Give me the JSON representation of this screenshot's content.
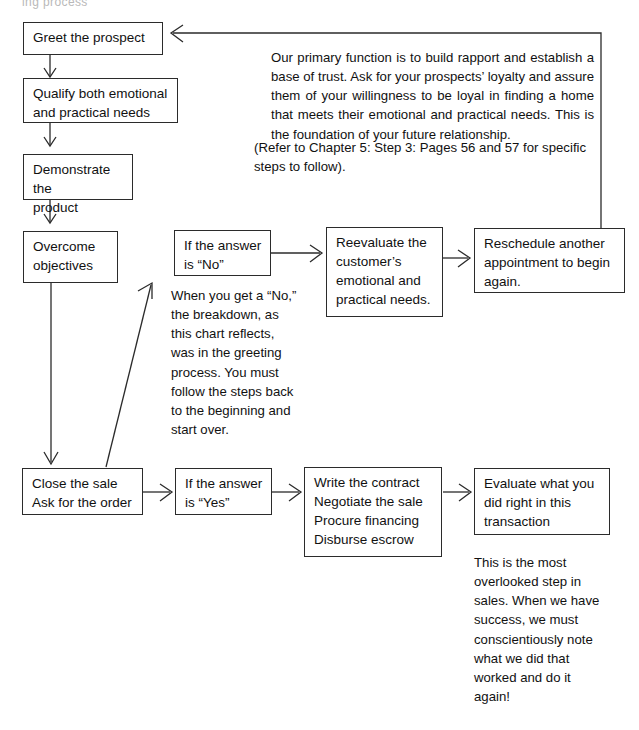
{
  "diagram": {
    "title_fragment": "ing  process",
    "nodes": {
      "greet": "Greet the  prospect",
      "qualify": "Qualify both emotional\nand practical needs",
      "demonstrate": "Demonstrate the\nproduct",
      "overcome": "Overcome\nobjectives",
      "answer_no": "If the answer\nis “No”",
      "reevaluate": "Reevaluate the\ncustomer’s\nemotional and\npractical needs.",
      "reschedule": "Reschedule another\nappointment to begin\nagain.",
      "close_sale": "Close the sale\nAsk for the order",
      "answer_yes": "If the answer\nis “Yes”",
      "contract": "Write the contract\nNegotiate the sale\nProcure financing\nDisburse escrow",
      "evaluate": "Evaluate what you\ndid right in this\ntransaction"
    },
    "notes": {
      "rapport": "     Our primary function is to build rapport and establish a base of trust. Ask for your prospects’ loyalty and assure them of your willingness to be loyal in finding a home that meets their emotional and practical needs. This is the foundation of your future relationship.",
      "reference": "(Refer to Chapter 5: Step 3: Pages 56 and 57 for specific steps to follow).",
      "breakdown": "When you get a “No,”\nthe breakdown, as\nthis chart reflects,\nwas in the greeting\nprocess. You must\nfollow the steps back\nto the beginning and\nstart over.",
      "overlooked": "This is the most\noverlooked step in\nsales. When we have\nsuccess, we must\nconscientiously note\nwhat we did that\nworked and do it\nagain!"
    },
    "colors": {
      "stroke": "#2b2b2b",
      "text": "#111111",
      "background": "#ffffff"
    }
  }
}
